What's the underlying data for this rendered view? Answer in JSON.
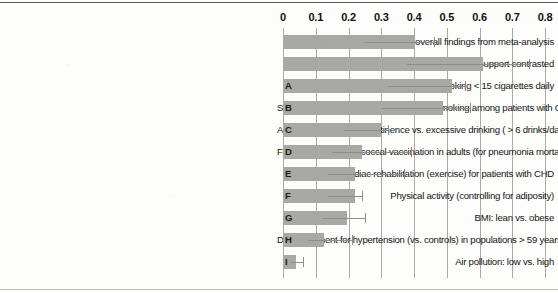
{
  "chart_data": {
    "type": "bar",
    "orientation": "horizontal",
    "title": "",
    "subtitle": "",
    "xlabel": "",
    "ylabel": "",
    "xlim": [
      0,
      0.8
    ],
    "xticks": [
      "0",
      "0.1",
      "0.2",
      "0.3",
      "0.4",
      "0.5",
      "0.6",
      "0.7",
      "0.8"
    ],
    "xtick_values": [
      0,
      0.1,
      0.2,
      0.3,
      0.4,
      0.5,
      0.6,
      0.7,
      0.8
    ],
    "grid": true,
    "legend": "none",
    "value_label": "Effect size",
    "bar_color": "#a8a8a4",
    "error_color": "#8d8d89",
    "grid_color": "#a9a9a6",
    "categories": [
      "Social relationships: overall findings from meta-analysis",
      "Social relationships: high vs. low social support contrasted",
      "Smoking < 15 cigarettes daily",
      "Smoking cessation: cease vs. continue smoking among patients with CHD",
      "Alcohol consumption: abstinence vs. excessive drinking ( > 6 drinks/day)",
      "Flu vaccine: pneumococcal vaccination in adults (for pneumonia mortality)",
      "Cardiac rehabilitation (exercise) for patients with CHD",
      "Physical activity (controlling for adiposity)",
      "BMI: lean vs. obese",
      "Drug treatment for hypertension (vs. controls) in populations > 59 years",
      "Air pollution: low vs. high"
    ],
    "bar_letters": [
      "",
      "",
      "A",
      "B",
      "C",
      "D",
      "E",
      "F",
      "G",
      "H",
      "I"
    ],
    "values": [
      0.4,
      0.61,
      0.515,
      0.49,
      0.3,
      0.24,
      0.22,
      0.22,
      0.195,
      0.125,
      0.04
    ],
    "ci_low": [
      0.4,
      0.46,
      0.515,
      0.49,
      0.3,
      0.24,
      0.22,
      0.22,
      0.195,
      0.125,
      0.04
    ],
    "ci_high": [
      0.46,
      0.75,
      0.555,
      0.57,
      0.32,
      0.39,
      0.37,
      0.24,
      0.25,
      0.21,
      0.06
    ],
    "series": [
      {
        "name": "Effect size",
        "values": [
          0.4,
          0.61,
          0.515,
          0.49,
          0.3,
          0.24,
          0.22,
          0.22,
          0.195,
          0.125,
          0.04
        ]
      }
    ]
  }
}
